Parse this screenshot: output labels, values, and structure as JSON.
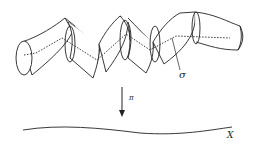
{
  "figure": {
    "labels": {
      "section": "σ",
      "projection": "π",
      "base": "X"
    },
    "elements": [
      "tube-bundle",
      "dashed-section-curve",
      "projection-arrow",
      "base-curve"
    ]
  }
}
